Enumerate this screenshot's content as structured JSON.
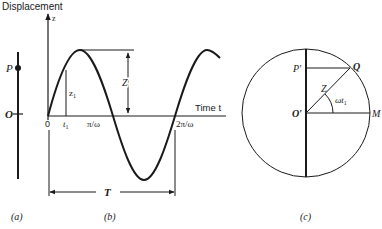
{
  "panel_a": {
    "label": "(a)",
    "point_p": "P",
    "point_o": "O"
  },
  "panel_b": {
    "label": "(b)",
    "y_axis_title": "Displacement",
    "y_axis_symbol": "z",
    "x_axis_title": "Time t",
    "origin": "0",
    "tick_t1": "t",
    "tick_t1_sub": "1",
    "tick_half_period": "π/ω",
    "tick_full_period": "2π/ω",
    "amplitude_label": "Z",
    "z1_label": "z",
    "z1_sub": "1",
    "period_label": "T"
  },
  "panel_c": {
    "label": "(c)",
    "point_p_prime": "P′",
    "point_q": "Q",
    "point_o_prime": "O′",
    "point_m": "M",
    "radius_label": "Z",
    "angle_label": "ωt",
    "angle_sub": "1"
  },
  "colors": {
    "ink": "#1a1a1a",
    "background": "#ffffff"
  }
}
